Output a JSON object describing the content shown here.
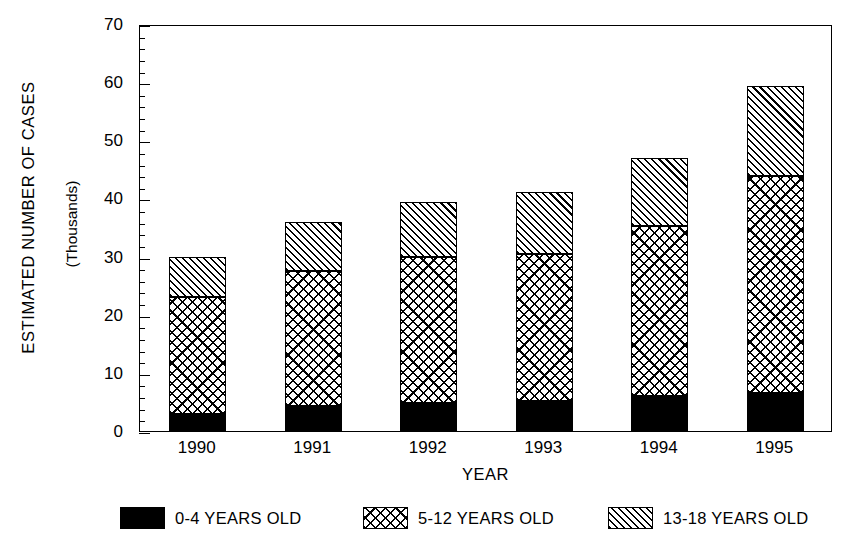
{
  "chart_data": {
    "type": "bar",
    "stacked": true,
    "title": "",
    "xlabel": "YEAR",
    "ylabel": "ESTIMATED NUMBER OF CASES",
    "ylabel_sub": "(Thousands)",
    "categories": [
      "1990",
      "1991",
      "1992",
      "1993",
      "1994",
      "1995"
    ],
    "ylim": [
      0,
      70
    ],
    "ytick_labels": [
      "0",
      "10",
      "20",
      "30",
      "40",
      "50",
      "60",
      "70"
    ],
    "ytick_values": [
      0,
      10,
      20,
      30,
      40,
      50,
      60,
      70
    ],
    "ytick_minor_step": 2,
    "grid": false,
    "legend_position": "bottom",
    "series": [
      {
        "name": "0-4 YEARS OLD",
        "pattern": "solid-black",
        "color": "#000000",
        "values": [
          3.0,
          4.3,
          4.8,
          5.2,
          6.0,
          6.5
        ]
      },
      {
        "name": "5-12 YEARS OLD",
        "pattern": "crosshatch",
        "color": "#ffffff",
        "values": [
          20.0,
          23.2,
          25.2,
          25.3,
          29.3,
          37.4
        ]
      },
      {
        "name": "13-18 YEARS OLD",
        "pattern": "diagonal-hatch",
        "color": "#ffffff",
        "values": [
          7.0,
          8.5,
          9.4,
          10.6,
          11.7,
          15.4
        ]
      }
    ],
    "totals": [
      30.0,
      36.0,
      39.4,
      41.1,
      47.0,
      59.3
    ]
  },
  "axes": {
    "y_title": "ESTIMATED NUMBER OF CASES",
    "y_subtitle": "(Thousands)",
    "x_title": "YEAR"
  },
  "legend": {
    "items": [
      {
        "label": "0-4 YEARS OLD"
      },
      {
        "label": "5-12 YEARS OLD"
      },
      {
        "label": "13-18 YEARS OLD"
      }
    ]
  }
}
